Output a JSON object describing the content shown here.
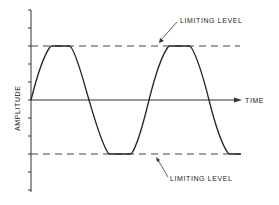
{
  "diagram": {
    "y_axis_label": "AMPLITUDE",
    "x_axis_label": "TIME",
    "upper_limit_label": "LIMITING LEVEL",
    "lower_limit_label": "LIMITING LEVEL",
    "line_color": "#333333",
    "waveform": "sine wave clipped (flattened) at upper and lower limiting levels"
  }
}
